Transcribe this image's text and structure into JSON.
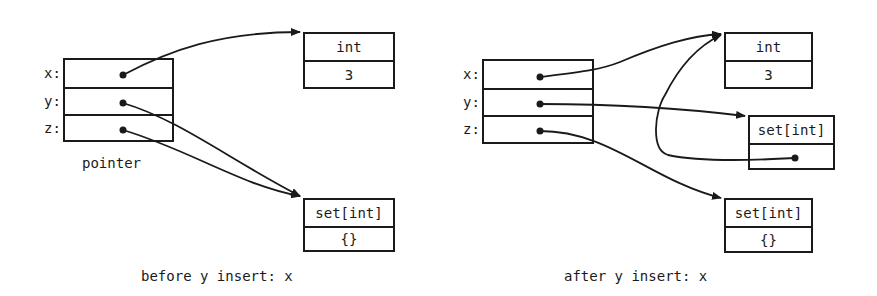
{
  "left_diagram": {
    "caption": "before y insert: x",
    "pointer_box": {
      "label": "pointer",
      "rows": [
        {
          "var": "x:",
          "points_to": "int"
        },
        {
          "var": "y:",
          "points_to": "set[int]"
        },
        {
          "var": "z:",
          "points_to": "set[int]"
        }
      ]
    },
    "int_object": {
      "type": "int",
      "value": "3"
    },
    "set_object": {
      "type": "set[int]",
      "value": "{}"
    }
  },
  "right_diagram": {
    "caption": "after y insert: x",
    "pointer_box": {
      "rows": [
        {
          "var": "x:",
          "points_to": "int"
        },
        {
          "var": "y:",
          "points_to": "new set[int]"
        },
        {
          "var": "z:",
          "points_to": "set[int] (empty)"
        }
      ]
    },
    "int_object": {
      "type": "int",
      "value": "3"
    },
    "new_set_object": {
      "type": "set[int]",
      "value": "",
      "element_points_to": "int"
    },
    "set_object": {
      "type": "set[int]",
      "value": "{}"
    }
  },
  "colors": {
    "ink": "#1a1a1a",
    "background": "#ffffff"
  }
}
